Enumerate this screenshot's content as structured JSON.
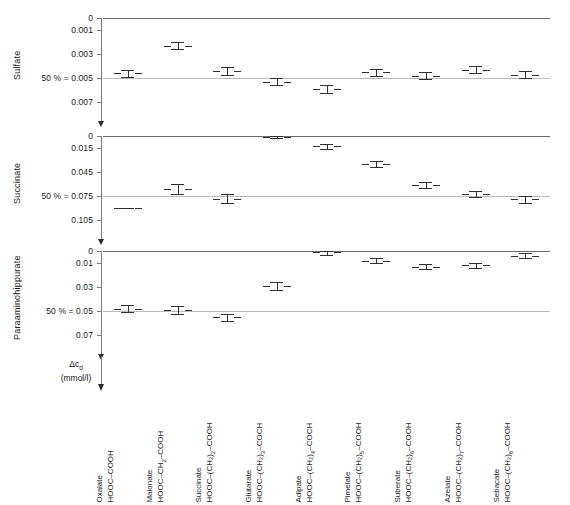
{
  "figure": {
    "value_axis_label_main": "Δc",
    "value_axis_label_sub": "d",
    "value_axis_units": "(mmol/l)"
  },
  "panels": [
    {
      "title": "Sulfate",
      "ticks": [
        "0",
        "0.001",
        "0.003",
        "0.005",
        "0.007"
      ],
      "tick_values": [
        0,
        0.001,
        0.003,
        0.005,
        0.007
      ],
      "fifty_percent_label": "50 % = 0.005",
      "fifty_percent_value": 0.005
    },
    {
      "title": "Succinate",
      "ticks": [
        "0",
        "0.015",
        "0.045",
        "0.075",
        "0.105"
      ],
      "tick_values": [
        0,
        0.015,
        0.045,
        0.075,
        0.105
      ],
      "fifty_percent_label": "50 % = 0.075",
      "fifty_percent_value": 0.075
    },
    {
      "title": "Paraaminohippurate",
      "ticks": [
        "0",
        "0.01",
        "0.03",
        "0.05",
        "0.07"
      ],
      "tick_values": [
        0,
        0.01,
        0.03,
        0.05,
        0.07
      ],
      "fifty_percent_label": "50 % = 0.05",
      "fifty_percent_value": 0.05
    }
  ],
  "categories": [
    {
      "name": "Oxalate",
      "formula_pre": "HOOC–COOH",
      "formula_sub": "",
      "formula_post": ""
    },
    {
      "name": "Malonate",
      "formula_pre": "HOOC–CH",
      "formula_sub": "2",
      "formula_post": "–COOH"
    },
    {
      "name": "Succinate",
      "formula_pre": "HOOC–(CH₂)",
      "formula_sub": "2",
      "formula_post": "–COOH"
    },
    {
      "name": "Glutarate",
      "formula_pre": "HOOC–(CH₂)",
      "formula_sub": "3",
      "formula_post": "–COCH"
    },
    {
      "name": "Adipate",
      "formula_pre": "HOOC–(CH₂)",
      "formula_sub": "4",
      "formula_post": "–COCH"
    },
    {
      "name": "Pimelate",
      "formula_pre": "HOOC–(CH₂)",
      "formula_sub": "5",
      "formula_post": "–COOH"
    },
    {
      "name": "Suberate",
      "formula_pre": "HOOC–(CH₂)",
      "formula_sub": "6",
      "formula_post": "–COOH"
    },
    {
      "name": "Azelate",
      "formula_pre": "HOOC–(CH₂)",
      "formula_sub": "7",
      "formula_post": "–COOH"
    },
    {
      "name": "Sebacate",
      "formula_pre": "HOOC–(CH₂)",
      "formula_sub": "8",
      "formula_post": "–COOH"
    }
  ],
  "chart_data": {
    "type": "scatter",
    "title": "",
    "xlabel": "",
    "ylabel": "Δc_d (mmol/l)",
    "grid": true,
    "legend_position": "none",
    "note": "Three stacked panels, one per transported substrate. Each panel plots the inhibitor concentration (Δc_d, mmol/l) that produces 50 % inhibition, for nine dicarboxylic acids. Y axes are inverted (0 at top). Markers are mean ± SEM error bars.",
    "categories": [
      "Oxalate",
      "Malonate",
      "Succinate",
      "Glutarate",
      "Adipate",
      "Pimelate",
      "Suberate",
      "Azelate",
      "Sebacate"
    ],
    "panels": [
      {
        "name": "Sulfate",
        "ylabel": "Δc_d (mmol/l)",
        "ylim": [
          0,
          0.0078
        ],
        "y_inverted": true,
        "yticks": [
          0,
          0.001,
          0.003,
          0.005,
          0.007
        ],
        "reference_line": {
          "label": "50 % = 0.005",
          "value": 0.005
        },
        "values": [
          0.0046,
          0.0023,
          0.0044,
          0.0053,
          0.0059,
          0.0045,
          0.0048,
          0.0043,
          0.0047
        ],
        "err_low": [
          0.0043,
          0.002,
          0.0041,
          0.005,
          0.0056,
          0.0042,
          0.0045,
          0.004,
          0.0044
        ],
        "err_high": [
          0.0049,
          0.0026,
          0.0047,
          0.0056,
          0.0062,
          0.0048,
          0.0051,
          0.0046,
          0.005
        ]
      },
      {
        "name": "Succinate",
        "ylabel": "Δc_d (mmol/l)",
        "ylim": [
          0,
          0.117
        ],
        "y_inverted": true,
        "yticks": [
          0,
          0.015,
          0.045,
          0.075,
          0.105
        ],
        "reference_line": {
          "label": "50 % = 0.075",
          "value": 0.075
        },
        "values": [
          0.09,
          0.066,
          0.078,
          0.001,
          0.013,
          0.035,
          0.061,
          0.072,
          0.079
        ],
        "err_low": [
          0.09,
          0.06,
          0.072,
          0.0,
          0.01,
          0.031,
          0.057,
          0.068,
          0.075
        ],
        "err_high": [
          0.09,
          0.072,
          0.084,
          0.003,
          0.016,
          0.039,
          0.065,
          0.076,
          0.083
        ]
      },
      {
        "name": "Paraaminohippurate",
        "ylabel": "Δc_d (mmol/l)",
        "ylim": [
          0,
          0.078
        ],
        "y_inverted": true,
        "yticks": [
          0,
          0.01,
          0.03,
          0.05,
          0.07
        ],
        "reference_line": {
          "label": "50 % = 0.05",
          "value": 0.05
        },
        "values": [
          0.048,
          0.049,
          0.055,
          0.029,
          0.001,
          0.008,
          0.013,
          0.012,
          0.004,
          0.002
        ],
        "err_low": [
          0.045,
          0.046,
          0.052,
          0.026,
          0.0,
          0.006,
          0.011,
          0.01,
          0.002,
          0.0
        ],
        "err_high": [
          0.051,
          0.052,
          0.058,
          0.032,
          0.003,
          0.01,
          0.015,
          0.014,
          0.006,
          0.004
        ]
      }
    ]
  }
}
